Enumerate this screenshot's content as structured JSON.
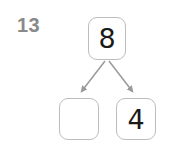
{
  "item": {
    "question_number": "13",
    "type": "number-bond"
  },
  "bond": {
    "whole": {
      "label": "8",
      "empty": false
    },
    "parts": [
      {
        "label": "",
        "empty": true
      },
      {
        "label": "4",
        "empty": false
      }
    ]
  },
  "connectors": [
    {
      "name": "arrow-whole-to-left-part"
    },
    {
      "name": "arrow-whole-to-right-part"
    }
  ],
  "colors": {
    "background": "#ffffff",
    "box_border": "#bdbdbd",
    "arrow": "#9a9a9a",
    "question_number": "#8a8a8a",
    "digit": "#1a1a1a"
  }
}
